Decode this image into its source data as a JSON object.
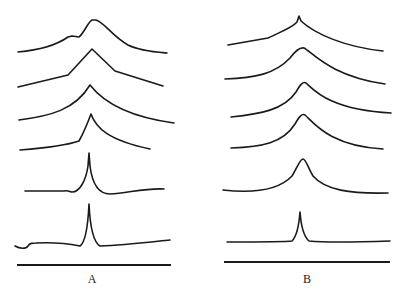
{
  "figure": {
    "stroke_color": "#1a1a1a",
    "background": "#ffffff",
    "panels": [
      {
        "label": "A",
        "label_x": 92,
        "baseline": {
          "x1": 17,
          "x2": 171,
          "y": 265
        },
        "traces": [
          {
            "d": "M18,52 C40,50 58,44 68,37 L72,36 L79,37 C84,33 88,22 92,20 L96,20 C104,22 112,36 128,45 C140,51 155,52 167,53"
          },
          {
            "d": "M18,87 L68,75 L92,49 L115,71 L163,86"
          },
          {
            "d": "M19,120 C50,116 75,110 90,85 C104,103 130,117 174,123"
          },
          {
            "d": "M20,150 C45,148 65,146 79,141 C84,132 88,122 91,114 C96,128 108,140 150,149"
          },
          {
            "d": "M25,191 L64,191 C68,190 70,192 72,192 C80,192 86,180 88,166 L89,153 L90,166 C92,182 98,194 110,194 C128,193 145,188 164,189"
          },
          {
            "d": "M15,246 C20,249 26,249 28,246 C30,243 32,243 36,243 C55,242 70,244 80,246 C86,242 88,225 89,204 C90,225 93,242 100,246 C125,245 150,242 170,240"
          }
        ]
      },
      {
        "label": "B",
        "label_x": 307,
        "baseline": {
          "x1": 224,
          "x2": 390,
          "y": 262
        },
        "traces": [
          {
            "d": "M228,45 L268,38 C280,32 292,28 297,22 L299,16 L301,21 C315,34 345,47 383,51"
          },
          {
            "d": "M225,79 C255,78 275,74 290,58 C296,50 300,47 304,48 C312,52 330,76 385,84"
          },
          {
            "d": "M231,117 C260,114 284,110 296,92 C300,85 303,81 306,83 C314,90 330,110 391,113"
          },
          {
            "d": "M231,148 C262,147 283,143 295,124 C299,117 302,113 305,115 C314,123 330,146 383,149"
          },
          {
            "d": "M223,190 C250,193 277,192 292,176 C297,168 300,159 303,159 C306,159 308,168 313,176 C325,190 350,194 388,193"
          },
          {
            "d": "M227,242 C250,242 285,242 292,241 C297,236 299,225 300,212 C301,225 303,236 309,241 C330,243 360,242 390,241"
          }
        ]
      }
    ]
  }
}
